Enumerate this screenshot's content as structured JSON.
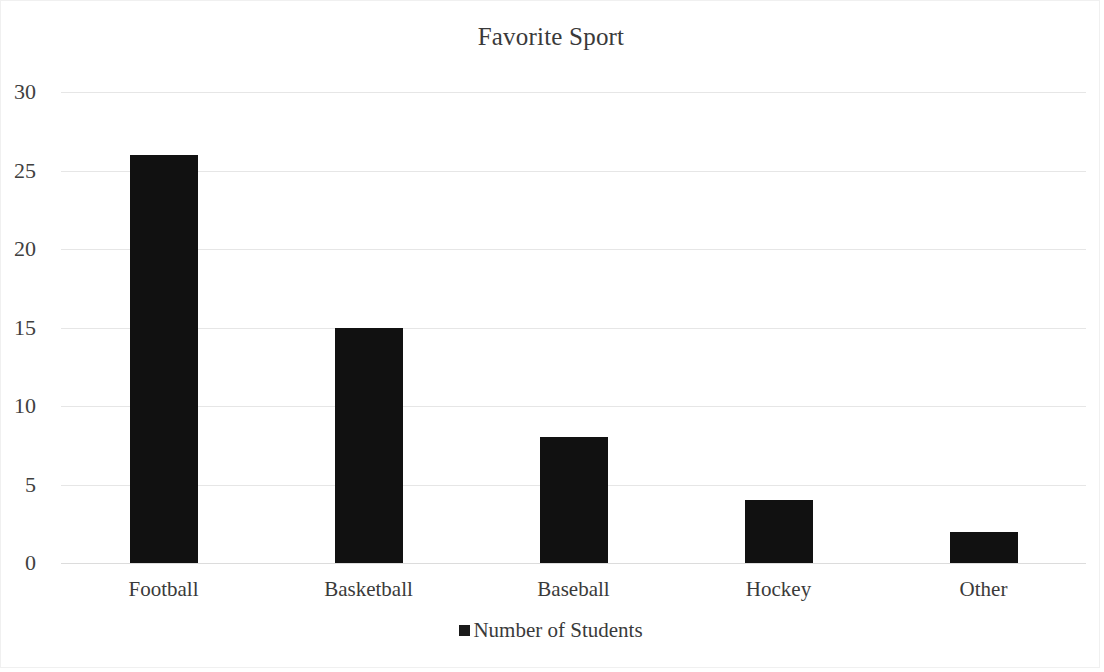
{
  "chart_data": {
    "type": "bar",
    "title": "Favorite Sport",
    "xlabel": "",
    "ylabel": "",
    "categories": [
      "Football",
      "Basketball",
      "Baseball",
      "Hockey",
      "Other"
    ],
    "series": [
      {
        "name": "Number of Students",
        "values": [
          26,
          15,
          8,
          4,
          2
        ]
      }
    ],
    "yticks": [
      0,
      5,
      10,
      15,
      20,
      25,
      30
    ],
    "ylim": [
      0,
      30
    ],
    "grid": true,
    "legend_position": "bottom",
    "colors": {
      "bar": "#111111",
      "gridline": "#e6e6e6",
      "text": "#3a3a3a",
      "border": "#f0f0f0"
    }
  }
}
